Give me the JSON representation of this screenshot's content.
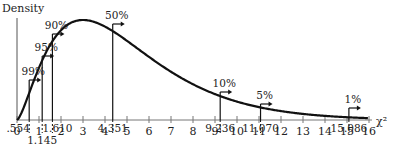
{
  "chart_data": {
    "type": "line",
    "title": "",
    "ylabel": "Density",
    "xlabel": "χ²",
    "xlim": [
      0,
      16
    ],
    "x_ticks": [
      0,
      1,
      2,
      3,
      4,
      5,
      6,
      7,
      8,
      9,
      10,
      11,
      12,
      13,
      14,
      15,
      16
    ],
    "distribution": "chi-square, df = 4",
    "critical_values": [
      {
        "percent": "99%",
        "value": ".554"
      },
      {
        "percent": "95%",
        "value": "1.145"
      },
      {
        "percent": "90%",
        "value": "1.610"
      },
      {
        "percent": "50%",
        "value": "4.351"
      },
      {
        "percent": "10%",
        "value": "9.236"
      },
      {
        "percent": "5%",
        "value": "11.070"
      },
      {
        "percent": "1%",
        "value": "15.086"
      }
    ],
    "grid": false,
    "legend": "none"
  },
  "labels": {
    "y_axis": "Density",
    "x_axis": "χ²"
  }
}
